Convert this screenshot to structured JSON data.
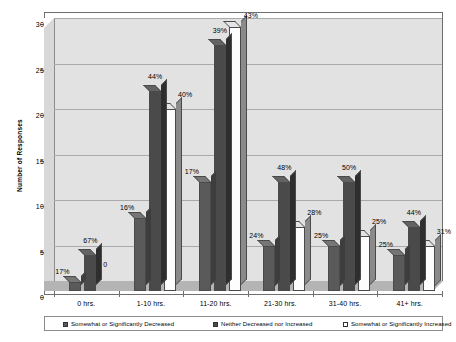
{
  "chart_data": {
    "type": "bar",
    "title": "",
    "subtitle": "",
    "xlabel": "",
    "ylabel": "Number of Responses",
    "ylim": [
      0,
      30
    ],
    "ytick_labels": [
      "0",
      "5",
      "10",
      "15",
      "20",
      "25",
      "30"
    ],
    "ytick_values": [
      0,
      5,
      10,
      15,
      20,
      25,
      30
    ],
    "grid": true,
    "legend_position": "bottom",
    "style": "3d-grouped-column-grayscale",
    "categories": [
      "0 hrs.",
      "1-10 hrs.",
      "11-20 hrs.",
      "21-30 hrs.",
      "31-40 hrs.",
      "41+ hrs."
    ],
    "series": [
      {
        "name": "Somewhat or Significantly Decreased",
        "color": "#5a5a5a",
        "values": [
          1,
          8,
          12,
          5,
          5,
          4
        ],
        "data_labels": [
          "17%",
          "16%",
          "17%",
          "24%",
          "25%",
          "25%"
        ]
      },
      {
        "name": "Neither Decreased nor Increased",
        "color": "#4a4a4a",
        "values": [
          4,
          22,
          27,
          12,
          12,
          7
        ],
        "data_labels": [
          "67%",
          "44%",
          "39%",
          "48%",
          "50%",
          "44%"
        ]
      },
      {
        "name": "Somewhat or Significantly Increased",
        "color": "#ffffff",
        "values": [
          0,
          20,
          29,
          7,
          6,
          5
        ],
        "data_labels": [
          "0",
          "40%",
          "43%",
          "28%",
          "25%",
          "31%"
        ]
      }
    ]
  },
  "legend": {
    "items": [
      "Somewhat or Significantly Decreased",
      "Neither Decreased nor Increased",
      "Somewhat or Significantly Increased"
    ]
  },
  "axis": {
    "y_title": "Number of Responses",
    "y_ticks": [
      "30",
      "25",
      "20",
      "15",
      "10",
      "5",
      "0"
    ],
    "x_ticks": [
      "0 hrs.",
      "1-10 hrs.",
      "11-20 hrs.",
      "21-30 hrs.",
      "31-40 hrs.",
      "41+ hrs."
    ]
  },
  "colors": {
    "plot_background": "#e2e2e2",
    "floor": "#b4b4b4",
    "gridline": "#a9a9a9",
    "series_decreased": "#5a5a5a",
    "series_neither": "#4a4a4a",
    "series_increased": "#ffffff",
    "border": "#6e6e6e"
  }
}
